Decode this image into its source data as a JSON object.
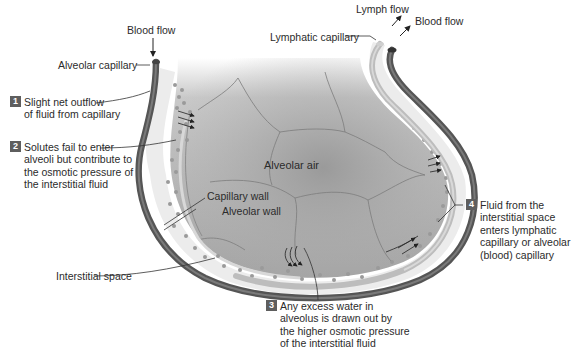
{
  "figure": {
    "colors": {
      "background": "#ffffff",
      "alveolar_air": "#a9a9a9",
      "alveolar_air_light": "#c4c4c4",
      "interstitial_space": "#ebebeb",
      "solute_dots": "#9a9a9a",
      "blood_capillary": "#5a5a5a",
      "lymphatic_capillary": "#b9b9b9",
      "step_badge": "#5e5e5e",
      "text": "#2b2b2b",
      "leader_lines": "#333333"
    }
  },
  "labels": {
    "blood_flow_in": "Blood flow",
    "alveolar_capillary": "Alveolar capillary",
    "lymph_flow": "Lymph flow",
    "blood_flow_out": "Blood flow",
    "lymphatic_capillary": "Lymphatic capillary",
    "alveolar_air": "Alveolar air",
    "capillary_wall": "Capillary wall",
    "alveolar_wall": "Alveolar wall",
    "interstitial_space": "Interstitial space"
  },
  "steps": [
    {
      "number": "1",
      "lines": [
        "Slight net outflow",
        "of fluid from capillary"
      ]
    },
    {
      "number": "2",
      "lines": [
        "Solutes fail to enter",
        "alveoli but contribute to",
        "the osmotic pressure of",
        "the interstitial fluid"
      ]
    },
    {
      "number": "3",
      "lines": [
        "Any excess water in",
        "alveolus is drawn out by",
        "the higher osmotic pressure",
        "of the interstitial fluid"
      ]
    },
    {
      "number": "4",
      "lines": [
        "Fluid from the",
        "interstitial space",
        "enters lymphatic",
        "capillary or alveolar",
        "(blood) capillary"
      ]
    }
  ]
}
